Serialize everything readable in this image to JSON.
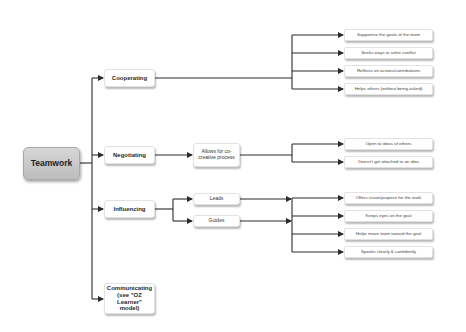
{
  "diagram": {
    "type": "mind-map / tree",
    "root": {
      "label": "Teamwork"
    },
    "branches": [
      {
        "label": "Cooperating",
        "children": [],
        "leaves": [
          "Supportive the goals of the team",
          "Seeks ways to solve conflict",
          "Reflects on actions/contributions",
          "Helps others (without being asked)"
        ]
      },
      {
        "label": "Negotiating",
        "children": [
          {
            "label": "Allows for co-creative process"
          }
        ],
        "leaves": [
          "Open to ideas of others",
          "Doesn't get attached to an idea"
        ]
      },
      {
        "label": "Influencing",
        "children": [
          {
            "label": "Leads"
          },
          {
            "label": "Guides"
          }
        ],
        "leaves": [
          "Offers vision/purpose for the work",
          "Keeps eyes on the goal",
          "Helps move team toward the goal",
          "Speaks clearly & confidently"
        ]
      },
      {
        "label": "Communicating (see \"OZ Learner\" model)",
        "children": [],
        "leaves": []
      }
    ]
  },
  "colors": {
    "root_fill_top": "#d6d6d6",
    "root_fill_bottom": "#bdbdbd",
    "node_fill": "#ffffff",
    "connector": "#2b2b2b",
    "background": "#ffffff"
  }
}
